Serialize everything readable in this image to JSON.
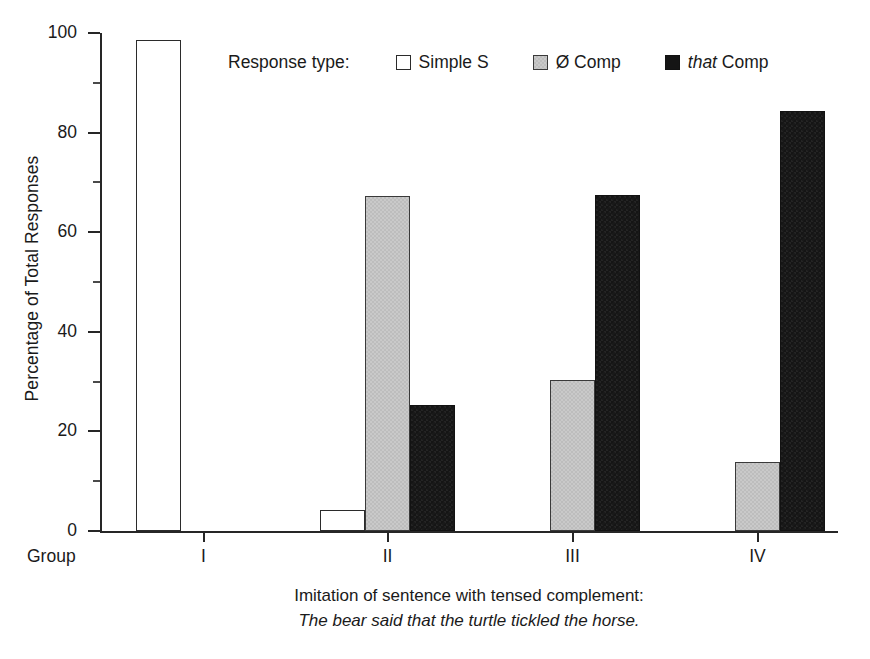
{
  "chart_data": {
    "type": "bar",
    "title": "",
    "xlabel": "Imitation of sentence with tensed complement: The bear said that the turtle tickled the horse.",
    "ylabel": "Percentage of Total Responses",
    "ylim": [
      0,
      100
    ],
    "ytick_labels": [
      "0",
      "20",
      "40",
      "60",
      "80",
      "100"
    ],
    "ytick_values": [
      0,
      20,
      40,
      60,
      80,
      100
    ],
    "yminor_values": [
      10,
      30,
      50,
      70,
      90
    ],
    "grid": false,
    "legend_position": "top-center",
    "categories": [
      "I",
      "II",
      "III",
      "IV"
    ],
    "category_axis_label": "Group",
    "series": [
      {
        "name": "Simple S",
        "key": "simple",
        "values": [
          98.5,
          4.2,
          0,
          0
        ]
      },
      {
        "name": "Ø Comp",
        "key": "zero-comp",
        "values": [
          0,
          67.3,
          30.3,
          13.8
        ]
      },
      {
        "name": "that Comp",
        "key": "that-comp",
        "values": [
          0,
          25.3,
          67.5,
          84.4
        ]
      }
    ]
  },
  "axes": {
    "y_title": "Percentage of Total Responses",
    "ticks_y": [
      {
        "label": "100",
        "value": 100
      },
      {
        "label": "80",
        "value": 80
      },
      {
        "label": "60",
        "value": 60
      },
      {
        "label": "40",
        "value": 40
      },
      {
        "label": "20",
        "value": 20
      },
      {
        "label": "0",
        "value": 0
      }
    ],
    "group_axis_prefix": "Group",
    "ticks_x": [
      {
        "label": "I"
      },
      {
        "label": "II"
      },
      {
        "label": "III"
      },
      {
        "label": "IV"
      }
    ]
  },
  "legend": {
    "title": "Response type:",
    "entries": [
      {
        "label": "Simple S",
        "swatch": "simple",
        "italic_prefix": ""
      },
      {
        "label": "Ø Comp",
        "swatch": "zero-comp",
        "italic_prefix": ""
      },
      {
        "label": "Comp",
        "swatch": "that-comp",
        "italic_prefix": "that"
      }
    ]
  },
  "caption": {
    "line1": "Imitation of sentence with tensed complement:",
    "line2": "The bear said that the turtle tickled the horse."
  },
  "colors": {
    "axis": "#262626",
    "text": "#1a1a1a",
    "simple_fill": "#ffffff",
    "zero_comp_fill": "#c9c9c9",
    "that_comp_fill": "#151515"
  }
}
